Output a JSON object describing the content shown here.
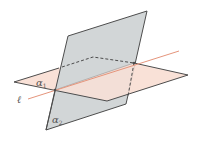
{
  "diagram": {
    "labels": {
      "plane1": "α",
      "plane1_sub": "1",
      "plane2": "α",
      "plane2_sub": "2",
      "line": "ℓ"
    },
    "colors": {
      "plane1_fill": "#f9e1d7",
      "plane2_fill": "#d2d6d7",
      "edge": "#4d4d4d",
      "line": "#e5957c"
    }
  }
}
